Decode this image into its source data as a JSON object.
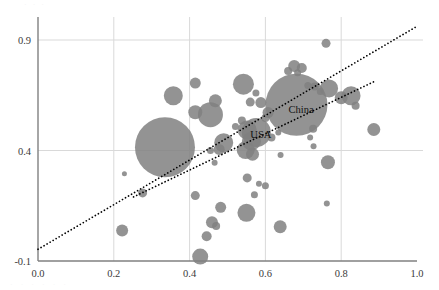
{
  "chart_data": {
    "type": "scatter",
    "title": "",
    "subtitle": "",
    "xlabel": "",
    "ylabel": "",
    "grid": true,
    "legend_position": "none",
    "xlim": [
      0.0,
      1.0
    ],
    "ylim": [
      -0.1,
      1.0
    ],
    "xticks": [
      0.0,
      0.2,
      0.4,
      0.6,
      0.8,
      1.0
    ],
    "xtick_labels": [
      "0.0",
      "0.2",
      "0.4",
      "0.6",
      "0.8",
      "1.0"
    ],
    "yticks": [
      -0.1,
      0.4,
      0.9
    ],
    "ytick_labels": [
      "-0.1",
      "0.4",
      "0.9"
    ],
    "marker_color": "#808080",
    "marker_opacity": 0.85,
    "line_color": "#000000",
    "grid_color": "#d9d9d9",
    "axis_color": "#808080",
    "bubbles": [
      {
        "x": 0.335,
        "y": 0.415,
        "r": 30.0,
        "label": ""
      },
      {
        "x": 0.682,
        "y": 0.607,
        "r": 31.0,
        "label": "China"
      },
      {
        "x": 0.576,
        "y": 0.482,
        "r": 14.5,
        "label": "USA"
      },
      {
        "x": 0.455,
        "y": 0.562,
        "r": 12.5,
        "label": ""
      },
      {
        "x": 0.415,
        "y": 0.573,
        "r": 7.0,
        "label": ""
      },
      {
        "x": 0.542,
        "y": 0.7,
        "r": 10.5,
        "label": ""
      },
      {
        "x": 0.357,
        "y": 0.648,
        "r": 9.5,
        "label": ""
      },
      {
        "x": 0.415,
        "y": 0.705,
        "r": 5.5,
        "label": ""
      },
      {
        "x": 0.468,
        "y": 0.625,
        "r": 6.5,
        "label": ""
      },
      {
        "x": 0.56,
        "y": 0.619,
        "r": 4.5,
        "label": ""
      },
      {
        "x": 0.588,
        "y": 0.617,
        "r": 5.5,
        "label": ""
      },
      {
        "x": 0.575,
        "y": 0.66,
        "r": 3.5,
        "label": ""
      },
      {
        "x": 0.607,
        "y": 0.572,
        "r": 5.5,
        "label": ""
      },
      {
        "x": 0.6,
        "y": 0.547,
        "r": 4.0,
        "label": ""
      },
      {
        "x": 0.538,
        "y": 0.536,
        "r": 4.0,
        "label": ""
      },
      {
        "x": 0.521,
        "y": 0.509,
        "r": 3.5,
        "label": ""
      },
      {
        "x": 0.552,
        "y": 0.493,
        "r": 9.5,
        "label": ""
      },
      {
        "x": 0.563,
        "y": 0.443,
        "r": 9.5,
        "label": ""
      },
      {
        "x": 0.49,
        "y": 0.435,
        "r": 9.5,
        "label": ""
      },
      {
        "x": 0.478,
        "y": 0.405,
        "r": 5.5,
        "label": ""
      },
      {
        "x": 0.548,
        "y": 0.402,
        "r": 9.0,
        "label": ""
      },
      {
        "x": 0.566,
        "y": 0.383,
        "r": 6.5,
        "label": ""
      },
      {
        "x": 0.616,
        "y": 0.459,
        "r": 4.0,
        "label": ""
      },
      {
        "x": 0.634,
        "y": 0.482,
        "r": 3.0,
        "label": ""
      },
      {
        "x": 0.66,
        "y": 0.76,
        "r": 4.0,
        "label": ""
      },
      {
        "x": 0.676,
        "y": 0.782,
        "r": 6.0,
        "label": ""
      },
      {
        "x": 0.696,
        "y": 0.773,
        "r": 5.0,
        "label": ""
      },
      {
        "x": 0.685,
        "y": 0.752,
        "r": 3.5,
        "label": ""
      },
      {
        "x": 0.712,
        "y": 0.694,
        "r": 3.5,
        "label": ""
      },
      {
        "x": 0.73,
        "y": 0.69,
        "r": 4.0,
        "label": ""
      },
      {
        "x": 0.745,
        "y": 0.667,
        "r": 3.5,
        "label": ""
      },
      {
        "x": 0.726,
        "y": 0.498,
        "r": 4.0,
        "label": ""
      },
      {
        "x": 0.718,
        "y": 0.459,
        "r": 3.0,
        "label": ""
      },
      {
        "x": 0.768,
        "y": 0.681,
        "r": 9.0,
        "label": ""
      },
      {
        "x": 0.8,
        "y": 0.639,
        "r": 6.5,
        "label": ""
      },
      {
        "x": 0.826,
        "y": 0.648,
        "r": 9.5,
        "label": ""
      },
      {
        "x": 0.838,
        "y": 0.602,
        "r": 4.0,
        "label": ""
      },
      {
        "x": 0.76,
        "y": 0.885,
        "r": 4.5,
        "label": ""
      },
      {
        "x": 0.886,
        "y": 0.495,
        "r": 6.5,
        "label": ""
      },
      {
        "x": 0.727,
        "y": 0.419,
        "r": 3.0,
        "label": ""
      },
      {
        "x": 0.765,
        "y": 0.347,
        "r": 7.0,
        "label": ""
      },
      {
        "x": 0.552,
        "y": 0.276,
        "r": 4.5,
        "label": ""
      },
      {
        "x": 0.583,
        "y": 0.25,
        "r": 3.0,
        "label": ""
      },
      {
        "x": 0.6,
        "y": 0.24,
        "r": 3.5,
        "label": ""
      },
      {
        "x": 0.571,
        "y": 0.2,
        "r": 3.5,
        "label": ""
      },
      {
        "x": 0.276,
        "y": 0.208,
        "r": 4.5,
        "label": ""
      },
      {
        "x": 0.415,
        "y": 0.196,
        "r": 4.5,
        "label": ""
      },
      {
        "x": 0.228,
        "y": 0.295,
        "r": 2.5,
        "label": ""
      },
      {
        "x": 0.466,
        "y": 0.345,
        "r": 3.0,
        "label": ""
      },
      {
        "x": 0.482,
        "y": 0.143,
        "r": 5.5,
        "label": ""
      },
      {
        "x": 0.459,
        "y": 0.075,
        "r": 6.0,
        "label": ""
      },
      {
        "x": 0.47,
        "y": 0.058,
        "r": 4.0,
        "label": ""
      },
      {
        "x": 0.55,
        "y": 0.118,
        "r": 9.0,
        "label": ""
      },
      {
        "x": 0.639,
        "y": 0.055,
        "r": 6.5,
        "label": ""
      },
      {
        "x": 0.222,
        "y": 0.038,
        "r": 6.0,
        "label": ""
      },
      {
        "x": 0.445,
        "y": 0.012,
        "r": 5.0,
        "label": ""
      },
      {
        "x": 0.428,
        "y": -0.08,
        "r": 8.0,
        "label": ""
      },
      {
        "x": 0.762,
        "y": 0.16,
        "r": 3.0,
        "label": ""
      },
      {
        "x": 0.64,
        "y": 0.38,
        "r": 3.0,
        "label": ""
      },
      {
        "x": 0.455,
        "y": 0.4,
        "r": 3.5,
        "label": ""
      }
    ],
    "lines": [
      {
        "name": "upper-trend",
        "style": "dotted",
        "x0": 0.0,
        "y0": -0.047,
        "x1": 0.995,
        "y1": 0.957
      },
      {
        "name": "lower-trend",
        "style": "dotted",
        "x0": 0.252,
        "y0": 0.19,
        "x1": 0.893,
        "y1": 0.717
      }
    ]
  },
  "annotations": [
    {
      "name": "china-label",
      "text": "China",
      "x": 0.694,
      "y": 0.57
    },
    {
      "name": "usa-label",
      "text": "USA",
      "x": 0.588,
      "y": 0.455
    }
  ],
  "ghost": {
    "top_artifact": "· · ·",
    "bottom_artifact": "· ·  · ·   · ·"
  }
}
